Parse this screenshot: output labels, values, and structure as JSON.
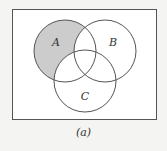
{
  "diagram": {
    "type": "venn",
    "universe": {
      "x": 12,
      "y": 9,
      "width": 145,
      "height": 110,
      "fill": "#ffffff",
      "stroke": "#555555"
    },
    "sets": [
      {
        "label": "A",
        "cx": 65,
        "cy": 51,
        "r": 31,
        "label_x": 56,
        "label_y": 46
      },
      {
        "label": "B",
        "cx": 105,
        "cy": 51,
        "r": 31,
        "label_x": 113,
        "label_y": 46
      },
      {
        "label": "C",
        "cx": 85,
        "cy": 81,
        "r": 31,
        "label_x": 85,
        "label_y": 100
      }
    ],
    "shaded_region": "A only (A − B − C)",
    "shade_color": "#cccccc",
    "caption": "(a)"
  }
}
